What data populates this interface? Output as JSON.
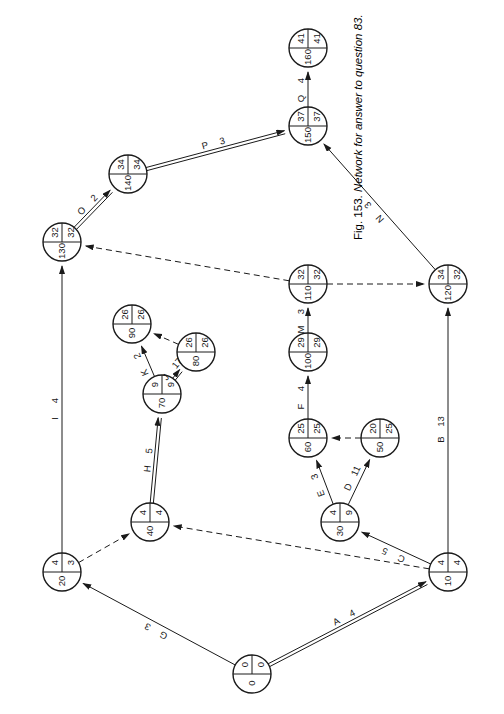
{
  "figure": {
    "caption_prefix": "Fig. 153.",
    "caption_text": "Network for answer to question 83.",
    "rotation_deg": -90,
    "background": "#ffffff",
    "stroke": "#1a1a1a"
  },
  "diagram": {
    "type": "activity-on-arrow-network",
    "node_label_layout": "event number (left), earliest event time (upper right), latest event time (lower right)",
    "nodes": [
      {
        "id": "0",
        "number": "0",
        "earliest": "0",
        "latest": "0",
        "x": 40,
        "y": 252
      },
      {
        "id": "10",
        "number": "10",
        "earliest": "4",
        "latest": "4",
        "x": 142,
        "y": 448
      },
      {
        "id": "20",
        "number": "20",
        "earliest": "4",
        "latest": "3",
        "x": 142,
        "y": 62
      },
      {
        "id": "30",
        "number": "30",
        "earliest": "4",
        "latest": "9",
        "x": 192,
        "y": 340
      },
      {
        "id": "40",
        "number": "40",
        "earliest": "4",
        "latest": "4",
        "x": 192,
        "y": 150
      },
      {
        "id": "50",
        "number": "50",
        "earliest": "20",
        "latest": "25",
        "x": 276,
        "y": 380
      },
      {
        "id": "60",
        "number": "60",
        "earliest": "25",
        "latest": "25",
        "x": 276,
        "y": 308
      },
      {
        "id": "70",
        "number": "70",
        "earliest": "9",
        "latest": "9",
        "x": 320,
        "y": 162
      },
      {
        "id": "80",
        "number": "80",
        "earliest": "26",
        "latest": "26",
        "x": 362,
        "y": 196
      },
      {
        "id": "90",
        "number": "90",
        "earliest": "26",
        "latest": "26",
        "x": 390,
        "y": 132
      },
      {
        "id": "100",
        "number": "100",
        "earliest": "29",
        "latest": "29",
        "x": 362,
        "y": 308
      },
      {
        "id": "110",
        "number": "110",
        "earliest": "32",
        "latest": "32",
        "x": 430,
        "y": 308
      },
      {
        "id": "120",
        "number": "120",
        "earliest": "34",
        "latest": "32",
        "x": 430,
        "y": 448
      },
      {
        "id": "130",
        "number": "130",
        "earliest": "32",
        "latest": "32",
        "x": 472,
        "y": 62
      },
      {
        "id": "140",
        "number": "140",
        "earliest": "34",
        "latest": "34",
        "x": 540,
        "y": 128
      },
      {
        "id": "150",
        "number": "150",
        "earliest": "37",
        "latest": "37",
        "x": 588,
        "y": 308
      },
      {
        "id": "160",
        "number": "160",
        "earliest": "41",
        "latest": "41",
        "x": 666,
        "y": 308
      }
    ],
    "edges": [
      {
        "activity": "A",
        "duration": "4",
        "from": "0",
        "to": "10",
        "style": "critical"
      },
      {
        "activity": "G",
        "duration": "3",
        "from": "0",
        "to": "20",
        "style": "normal"
      },
      {
        "activity": "B",
        "duration": "13",
        "from": "10",
        "to": "120",
        "style": "normal"
      },
      {
        "activity": "C",
        "duration": "5",
        "from": "10",
        "to": "30",
        "style": "normal"
      },
      {
        "activity": "",
        "duration": "",
        "from": "10",
        "to": "40",
        "style": "dummy"
      },
      {
        "activity": "",
        "duration": "",
        "from": "20",
        "to": "40",
        "style": "dummy"
      },
      {
        "activity": "I",
        "duration": "4",
        "from": "20",
        "to": "130",
        "style": "normal"
      },
      {
        "activity": "D",
        "duration": "11",
        "from": "30",
        "to": "50",
        "style": "normal"
      },
      {
        "activity": "E",
        "duration": "3",
        "from": "30",
        "to": "60",
        "style": "normal"
      },
      {
        "activity": "H",
        "duration": "5",
        "from": "40",
        "to": "70",
        "style": "critical"
      },
      {
        "activity": "",
        "duration": "",
        "from": "50",
        "to": "60",
        "style": "dummy"
      },
      {
        "activity": "F",
        "duration": "4",
        "from": "60",
        "to": "100",
        "style": "normal"
      },
      {
        "activity": "J",
        "duration": "17",
        "from": "70",
        "to": "80",
        "style": "critical"
      },
      {
        "activity": "K",
        "duration": "2",
        "from": "70",
        "to": "90",
        "style": "normal"
      },
      {
        "activity": "",
        "duration": "",
        "from": "80",
        "to": "90",
        "style": "dummy"
      },
      {
        "activity": "M",
        "duration": "3",
        "from": "100",
        "to": "110",
        "style": "normal"
      },
      {
        "activity": "",
        "duration": "",
        "from": "110",
        "to": "120",
        "style": "dummy"
      },
      {
        "activity": "",
        "duration": "",
        "from": "110",
        "to": "130",
        "style": "dummy"
      },
      {
        "activity": "N",
        "duration": "3",
        "from": "120",
        "to": "150",
        "style": "normal"
      },
      {
        "activity": "O",
        "duration": "2",
        "from": "130",
        "to": "140",
        "style": "critical"
      },
      {
        "activity": "P",
        "duration": "3",
        "from": "140",
        "to": "150",
        "style": "critical"
      },
      {
        "activity": "Q",
        "duration": "4",
        "from": "150",
        "to": "160",
        "style": "normal"
      }
    ]
  }
}
